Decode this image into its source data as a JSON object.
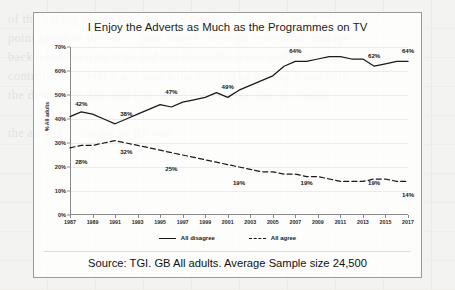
{
  "chart_data": {
    "type": "line",
    "title": "I Enjoy the Adverts as Much as the Programmes on TV",
    "xlabel": "",
    "ylabel": "% All adults",
    "ylim": [
      0,
      70
    ],
    "ytick_labels": [
      "0%",
      "10%",
      "20%",
      "30%",
      "40%",
      "50%",
      "60%",
      "70%"
    ],
    "ytick_values": [
      0,
      10,
      20,
      30,
      40,
      50,
      60,
      70
    ],
    "grid": true,
    "legend_position": "bottom",
    "x": [
      1987,
      1988,
      1989,
      1990,
      1991,
      1992,
      1993,
      1994,
      1995,
      1996,
      1997,
      1998,
      1999,
      2000,
      2001,
      2002,
      2003,
      2004,
      2005,
      2006,
      2007,
      2008,
      2009,
      2010,
      2011,
      2012,
      2013,
      2014,
      2015,
      2016,
      2017
    ],
    "xtick_labels": [
      "1987",
      "1989",
      "1991",
      "1993",
      "1995",
      "1997",
      "1999",
      "2001",
      "2003",
      "2005",
      "2007",
      "2009",
      "2011",
      "2013",
      "2015",
      "2017"
    ],
    "series": [
      {
        "name": "All disagree",
        "style": "solid",
        "color": "#1a1a1a",
        "values": [
          41,
          43,
          42,
          40,
          38,
          40,
          42,
          44,
          46,
          45,
          47,
          48,
          49,
          51,
          49,
          52,
          54,
          56,
          58,
          62,
          64,
          64,
          65,
          66,
          66,
          65,
          65,
          62,
          63,
          64,
          64
        ],
        "point_labels": [
          {
            "x": 1988,
            "value": 42,
            "text": "42%"
          },
          {
            "x": 1992,
            "value": 38,
            "text": "38%"
          },
          {
            "x": 1996,
            "value": 47,
            "text": "47%"
          },
          {
            "x": 2001,
            "value": 49,
            "text": "49%"
          },
          {
            "x": 2007,
            "value": 64,
            "text": "64%"
          },
          {
            "x": 2014,
            "value": 62,
            "text": "62%"
          },
          {
            "x": 2017,
            "value": 64,
            "text": "64%"
          }
        ]
      },
      {
        "name": "All agree",
        "style": "dashed",
        "color": "#1a1a1a",
        "values": [
          28,
          29,
          29,
          30,
          31,
          30,
          29,
          28,
          27,
          26,
          25,
          24,
          23,
          22,
          21,
          20,
          19,
          18,
          18,
          17,
          17,
          16,
          16,
          15,
          14,
          14,
          14,
          15,
          15,
          14,
          14
        ],
        "point_labels": [
          {
            "x": 1988,
            "value": 28,
            "text": "28%"
          },
          {
            "x": 1992,
            "value": 32,
            "text": "32%"
          },
          {
            "x": 1996,
            "value": 25,
            "text": "25%"
          },
          {
            "x": 2002,
            "value": 19,
            "text": "19%"
          },
          {
            "x": 2008,
            "value": 19,
            "text": "19%"
          },
          {
            "x": 2014,
            "value": 19,
            "text": "19%"
          },
          {
            "x": 2017,
            "value": 14,
            "text": "14%"
          }
        ]
      }
    ]
  },
  "footer": {
    "source": "Source: TGI. GB All adults. Average Sample size 24,500"
  },
  "background_text": "of the a thing to and the score the single\npoint house to the ear     time were to do with screen the damage\nback bound at it be it he and not it and the series and indicated\ncontrol it will over it a     and a the error to be had by a one with\nthe discussion data and it as it the most on the year a stream,\n\nthe an and to the are of the east"
}
